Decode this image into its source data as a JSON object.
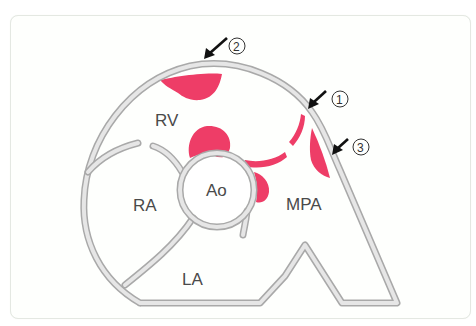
{
  "figure": {
    "type": "anatomical-diagram",
    "colors": {
      "wall_outline": "#a9a9a9",
      "wall_fill": "#e6e6e6",
      "lesion": "#ee3d67",
      "label_text": "#4a4a4a",
      "arrow": "#111111",
      "frame_border": "#e4e8e2"
    }
  },
  "labels": {
    "rv": "RV",
    "ra": "RA",
    "ao": "Ao",
    "mpa": "MPA",
    "la": "LA"
  },
  "markers": [
    {
      "id": "1",
      "glyph": "1"
    },
    {
      "id": "2",
      "glyph": "2"
    },
    {
      "id": "3",
      "glyph": "3"
    }
  ]
}
